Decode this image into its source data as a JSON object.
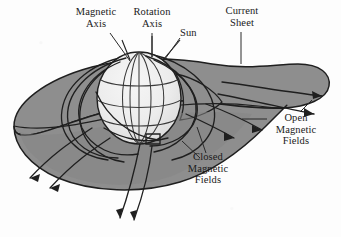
{
  "figure": {
    "type": "schematic-diagram",
    "background_color": "#fdfdfd",
    "ink_color": "#1a1a1a"
  },
  "colors": {
    "sheet_fill": "#8e8e8e",
    "sheet_fill_shadow": "#7d7d7d",
    "sun_fill": "#e9e9e9",
    "sun_highlight": "#f4f4f4",
    "line": "#1f1f1f",
    "leader": "#2a2a2a"
  },
  "labels": [
    {
      "id": "magnetic-axis",
      "lines": [
        "Magnetic",
        "Axis"
      ],
      "line1": "Magnetic",
      "line2": "Axis",
      "x": 76,
      "y": 8,
      "align": "center",
      "leader": {
        "from_x": 110,
        "from_y": 33,
        "to_x": 130,
        "to_y": 60
      }
    },
    {
      "id": "rotation-axis",
      "lines": [
        "Rotation",
        "Axis"
      ],
      "line1": "Rotation",
      "line2": "Axis",
      "x": 131,
      "y": 8,
      "align": "center",
      "leader": {
        "from_x": 152,
        "from_y": 33,
        "to_x": 152,
        "to_y": 57
      }
    },
    {
      "id": "sun",
      "lines": [
        "Sun"
      ],
      "line1": "Sun",
      "x": 180,
      "y": 28,
      "align": "left",
      "leader": {
        "from_x": 180,
        "from_y": 38,
        "to_x": 163,
        "to_y": 60
      }
    },
    {
      "id": "current-sheet",
      "lines": [
        "Current",
        "Sheet"
      ],
      "line1": "Current",
      "line2": "Sheet",
      "x": 226,
      "y": 7,
      "align": "center",
      "leader": {
        "from_x": 241,
        "from_y": 32,
        "to_x": 241,
        "to_y": 63
      }
    },
    {
      "id": "open-magnetic-fields",
      "lines": [
        "Open",
        "Magnetic",
        "Fields"
      ],
      "line1": "Open",
      "line2": "Magnetic",
      "line3": "Fields",
      "x": 268,
      "y": 113,
      "align": "center",
      "leaders": [
        {
          "from_x": 268,
          "from_y": 119,
          "to_x": 243,
          "to_y": 119
        },
        {
          "from_x": 298,
          "from_y": 113,
          "to_x": 310,
          "to_y": 100
        }
      ]
    },
    {
      "id": "closed-magnetic-fields",
      "lines": [
        "Closed",
        "Magnetic",
        "Fields"
      ],
      "line1": "Closed",
      "line2": "Magnetic",
      "line3": "Fields",
      "x": 200,
      "y": 152,
      "align": "center",
      "leaders": [
        {
          "from_x": 201,
          "from_y": 157,
          "to_x": 182,
          "to_y": 140
        },
        {
          "from_x": 205,
          "from_y": 152,
          "to_x": 196,
          "to_y": 126
        }
      ]
    }
  ],
  "elements": {
    "sun_sphere": {
      "name": "Sun",
      "center_x": 139,
      "center_y": 98,
      "radius_x": 42,
      "radius_y": 46,
      "meridians": 5,
      "parallels": 3
    },
    "current_sheet": {
      "name": "Current Sheet",
      "description": "Warped ballerina-skirt surface extending outward from the solar equator"
    },
    "open_field_arrows": {
      "count": 7,
      "description": "Open magnetic field lines with arrowheads directed away from the Sun"
    },
    "closed_field_loops": {
      "count": 6,
      "description": "Closed magnetic field loops anchored at the solar surface"
    }
  }
}
